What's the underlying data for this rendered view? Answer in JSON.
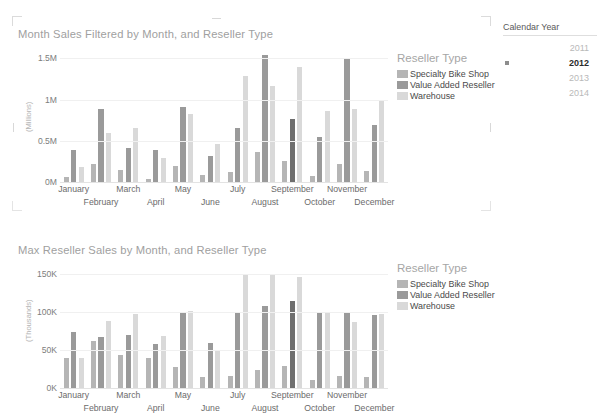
{
  "colors": {
    "specialty_bike_shop": "#b5b5b5",
    "value_added_reseller": "#9a9a9a",
    "value_added_reseller_highlight": "#6e6e6e",
    "warehouse": "#d9d9d9",
    "title": "#a0a0a0",
    "axis_text": "#7d7d7d",
    "gridline": "#f0f0f0"
  },
  "legend": {
    "title": "Reseller Type",
    "items": [
      {
        "label": "Specialty Bike Shop",
        "color": "#b5b5b5"
      },
      {
        "label": "Value Added Reseller",
        "color": "#9a9a9a"
      },
      {
        "label": "Warehouse",
        "color": "#d9d9d9"
      }
    ]
  },
  "slicer": {
    "title": "Calendar Year",
    "options": [
      {
        "value": "2011",
        "selected": false
      },
      {
        "value": "2012",
        "selected": true
      },
      {
        "value": "2013",
        "selected": false
      },
      {
        "value": "2014",
        "selected": false
      }
    ]
  },
  "chart_data": [
    {
      "type": "bar",
      "title": "Month Sales Filtered by Month, and Reseller Type",
      "xlabel": "",
      "ylabel": "(Millions)",
      "ylim": [
        0,
        1600000
      ],
      "yticks": [
        0,
        500000,
        1000000,
        1500000
      ],
      "ytick_labels": [
        "0M",
        "0.5M",
        "1M",
        "1.5M"
      ],
      "grid": true,
      "legend_position": "right",
      "categories": [
        "January",
        "February",
        "March",
        "April",
        "May",
        "June",
        "July",
        "August",
        "September",
        "October",
        "November",
        "December"
      ],
      "series": [
        {
          "name": "Specialty Bike Shop",
          "color": "#b5b5b5",
          "values": [
            60000,
            220000,
            150000,
            40000,
            200000,
            80000,
            120000,
            360000,
            260000,
            70000,
            215000,
            130000
          ]
        },
        {
          "name": "Value Added Reseller",
          "color": "#9a9a9a",
          "values": [
            390000,
            880000,
            410000,
            390000,
            905000,
            320000,
            660000,
            1540000,
            760000,
            550000,
            1490000,
            690000
          ],
          "highlight_category": "September"
        },
        {
          "name": "Warehouse",
          "color": "#d9d9d9",
          "values": [
            185000,
            590000,
            660000,
            290000,
            820000,
            460000,
            1280000,
            1160000,
            1400000,
            860000,
            880000,
            990000
          ]
        }
      ],
      "highlight": {
        "category": "September",
        "series": "Value Added Reseller",
        "color": "#6e6e6e"
      }
    },
    {
      "type": "bar",
      "title": "Max Reseller Sales by Month, and Reseller Type",
      "xlabel": "",
      "ylabel": "(Thousands)",
      "ylim": [
        0,
        160000
      ],
      "yticks": [
        0,
        50000,
        100000,
        150000
      ],
      "ytick_labels": [
        "0K",
        "50K",
        "100K",
        "150K"
      ],
      "grid": true,
      "legend_position": "right",
      "categories": [
        "January",
        "February",
        "March",
        "April",
        "May",
        "June",
        "July",
        "August",
        "September",
        "October",
        "November",
        "December"
      ],
      "series": [
        {
          "name": "Specialty Bike Shop",
          "color": "#b5b5b5",
          "values": [
            40000,
            62000,
            43000,
            40000,
            27000,
            15000,
            16000,
            24000,
            29000,
            11000,
            16000,
            14000
          ]
        },
        {
          "name": "Value Added Reseller",
          "color": "#9a9a9a",
          "values": [
            73000,
            67000,
            69000,
            58000,
            100000,
            59000,
            98000,
            108000,
            114000,
            99000,
            99000,
            96000
          ],
          "highlight_category": "September"
        },
        {
          "name": "Warehouse",
          "color": "#d9d9d9",
          "values": [
            40000,
            88000,
            97000,
            68000,
            101000,
            49000,
            150000,
            148000,
            146000,
            99000,
            87000,
            97000
          ]
        }
      ],
      "highlight": {
        "category": "September",
        "series": "Value Added Reseller",
        "color": "#6e6e6e"
      }
    }
  ]
}
